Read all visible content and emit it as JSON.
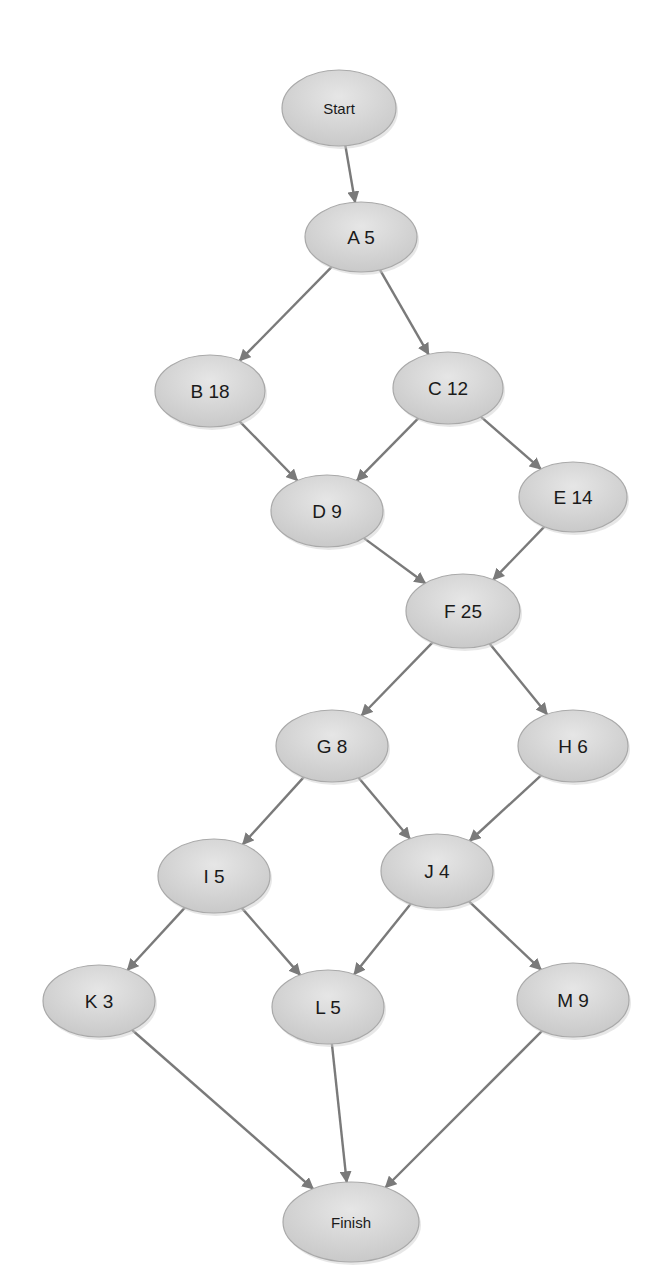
{
  "diagram": {
    "type": "network-flow",
    "colors": {
      "node_fill": "#d9d9d9",
      "node_stroke": "#a9a9a9",
      "edge": "#7a7a7a",
      "text": "#1a1a1a",
      "background": "#ffffff"
    },
    "nodes": [
      {
        "id": "Start",
        "label": "Start",
        "cx": 339,
        "cy": 108,
        "rx": 57,
        "ry": 38,
        "font": 15
      },
      {
        "id": "A",
        "label": "A 5",
        "cx": 361,
        "cy": 237,
        "rx": 56,
        "ry": 35,
        "font": 19
      },
      {
        "id": "B",
        "label": "B 18",
        "cx": 210,
        "cy": 391,
        "rx": 55,
        "ry": 36,
        "font": 19
      },
      {
        "id": "C",
        "label": "C 12",
        "cx": 448,
        "cy": 388,
        "rx": 55,
        "ry": 36,
        "font": 19
      },
      {
        "id": "D",
        "label": "D 9",
        "cx": 327,
        "cy": 511,
        "rx": 56,
        "ry": 36,
        "font": 19
      },
      {
        "id": "E",
        "label": "E 14",
        "cx": 573,
        "cy": 497,
        "rx": 54,
        "ry": 35,
        "font": 19
      },
      {
        "id": "F",
        "label": "F 25",
        "cx": 463,
        "cy": 611,
        "rx": 57,
        "ry": 37,
        "font": 19
      },
      {
        "id": "G",
        "label": "G 8",
        "cx": 332,
        "cy": 746,
        "rx": 56,
        "ry": 36,
        "font": 19
      },
      {
        "id": "H",
        "label": "H 6",
        "cx": 573,
        "cy": 746,
        "rx": 55,
        "ry": 36,
        "font": 19
      },
      {
        "id": "I",
        "label": "I 5",
        "cx": 214,
        "cy": 876,
        "rx": 56,
        "ry": 37,
        "font": 19
      },
      {
        "id": "J",
        "label": "J 4",
        "cx": 437,
        "cy": 871,
        "rx": 56,
        "ry": 37,
        "font": 19
      },
      {
        "id": "K",
        "label": "K 3",
        "cx": 99,
        "cy": 1001,
        "rx": 56,
        "ry": 36,
        "font": 19
      },
      {
        "id": "L",
        "label": "L 5",
        "cx": 328,
        "cy": 1007,
        "rx": 56,
        "ry": 37,
        "font": 19
      },
      {
        "id": "M",
        "label": "M 9",
        "cx": 573,
        "cy": 1000,
        "rx": 56,
        "ry": 37,
        "font": 19
      },
      {
        "id": "Finish",
        "label": "Finish",
        "cx": 351,
        "cy": 1222,
        "rx": 68,
        "ry": 40,
        "font": 15
      }
    ],
    "edges": [
      {
        "from": "Start",
        "to": "A"
      },
      {
        "from": "A",
        "to": "B"
      },
      {
        "from": "A",
        "to": "C"
      },
      {
        "from": "B",
        "to": "D"
      },
      {
        "from": "C",
        "to": "D"
      },
      {
        "from": "C",
        "to": "E"
      },
      {
        "from": "D",
        "to": "F"
      },
      {
        "from": "E",
        "to": "F"
      },
      {
        "from": "F",
        "to": "G"
      },
      {
        "from": "F",
        "to": "H"
      },
      {
        "from": "G",
        "to": "I"
      },
      {
        "from": "G",
        "to": "J"
      },
      {
        "from": "H",
        "to": "J"
      },
      {
        "from": "I",
        "to": "K"
      },
      {
        "from": "I",
        "to": "L"
      },
      {
        "from": "J",
        "to": "L"
      },
      {
        "from": "J",
        "to": "M"
      },
      {
        "from": "K",
        "to": "Finish"
      },
      {
        "from": "L",
        "to": "Finish"
      },
      {
        "from": "M",
        "to": "Finish"
      }
    ]
  }
}
